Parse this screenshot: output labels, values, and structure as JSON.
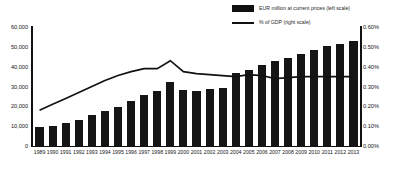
{
  "legend": {
    "position": "top-right",
    "entries": [
      {
        "marker": "bar-swatch",
        "label": "EUR million at current prices (left scale)"
      },
      {
        "marker": "line-swatch",
        "label": "% of GDP (right scale)"
      }
    ]
  },
  "axes": {
    "left_ticks": [
      "60,000",
      "50,000",
      "40,000",
      "30,000",
      "20,000",
      "10,000",
      "0"
    ],
    "right_ticks": [
      "0.60%",
      "0.50%",
      "0.40%",
      "0.30%",
      "0.20%",
      "0.10%",
      "0.00%"
    ]
  },
  "colors": {
    "bar": "#151515",
    "line": "#111111",
    "axis": "#111111",
    "background": "#ffffff"
  },
  "chart_data": {
    "type": "bar",
    "title": "",
    "subtitle": "",
    "xlabel": "",
    "ylabel": "",
    "y2label": "",
    "grid": false,
    "legend_position": "top-right",
    "categories": [
      "1989",
      "1990",
      "1991",
      "1992",
      "1993",
      "1994",
      "1995",
      "1996",
      "1997",
      "1998",
      "1999",
      "2000",
      "2001",
      "2002",
      "2003",
      "2004",
      "2005",
      "2006",
      "2007",
      "2008",
      "2009",
      "2010",
      "2011",
      "2012",
      "2013"
    ],
    "ylim": [
      0,
      60000
    ],
    "y2lim": [
      0,
      0.6
    ],
    "series": [
      {
        "name": "EUR million at current prices (left scale)",
        "type": "bar",
        "axis": "left",
        "values": [
          9500,
          10000,
          11500,
          13000,
          15500,
          17500,
          19500,
          22500,
          25500,
          27500,
          32500,
          28000,
          27500,
          28500,
          29000,
          37000,
          38500,
          41000,
          43000,
          44500,
          46500,
          48500,
          50500,
          51500,
          53000
        ]
      },
      {
        "name": "% of GDP (right scale)",
        "type": "line",
        "axis": "right",
        "values": [
          0.18,
          0.21,
          0.24,
          0.27,
          0.3,
          0.33,
          0.355,
          0.375,
          0.39,
          0.39,
          0.43,
          0.375,
          0.365,
          0.36,
          0.355,
          0.35,
          0.36,
          0.355,
          0.34,
          0.345,
          0.35,
          0.35,
          0.35,
          0.35,
          0.35
        ]
      }
    ]
  }
}
